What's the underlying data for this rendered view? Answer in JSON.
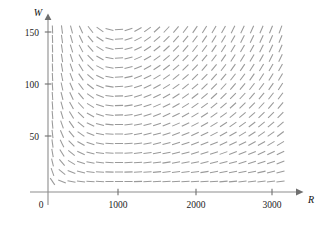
{
  "figure": {
    "title": "",
    "background_color": "#ffffff",
    "width": 325,
    "height": 229
  },
  "axes": {
    "x_axis_label": "R",
    "y_axis_label": "W",
    "origin_label": "0",
    "x_ticks": [
      {
        "label": "1000",
        "value": 1000
      },
      {
        "label": "2000",
        "value": 2000
      },
      {
        "label": "3000",
        "value": 3000
      }
    ],
    "y_ticks": [
      {
        "label": "50",
        "value": 50
      },
      {
        "label": "100",
        "value": 100
      },
      {
        "label": "150",
        "value": 150
      }
    ],
    "axis_color": "#8d8d8d",
    "tick_color": "#6f6f6f",
    "label_color": "#1b1b1b"
  },
  "chart_data": {
    "type": "scatter",
    "subtype": "direction-field",
    "title": "",
    "xlabel": "R",
    "ylabel": "W",
    "xlim": [
      0,
      3200
    ],
    "ylim": [
      0,
      165
    ],
    "grid": false,
    "legend": null,
    "segment_color": "#9a9a9a",
    "segment_length_px": 8.2,
    "grid_spacing": {
      "x": 9.5,
      "y": 9.5
    },
    "grid_origin_px": {
      "x": 52.5,
      "y": 181.5
    },
    "grid_count": {
      "cols": 25,
      "rows": 17
    },
    "model": {
      "name": "predator-prey (Lotka-Volterra)",
      "dR_dt": "0.08*R*(1 - R/1000) - 0.001*R*W",
      "dW_dt": "-0.02*W + 0.00002*R*W",
      "equilibrium_px": {
        "x": 125,
        "y": 111
      },
      "equilibrium_value": {
        "R": 1000,
        "W": 80
      }
    },
    "annotations": []
  }
}
